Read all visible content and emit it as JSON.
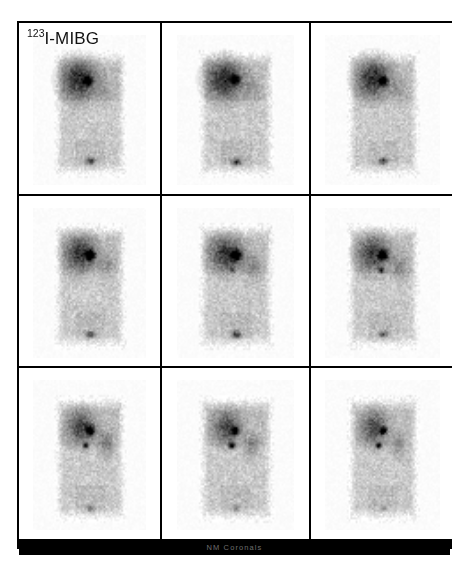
{
  "study": {
    "tracer_label_prefix": "123",
    "tracer_label_main": "I-MIBG",
    "footer_label": "NM Coronals",
    "frame_border_color": "#000000",
    "background_color": "#ffffff",
    "footer_bar_color": "#000000",
    "footer_text_color": "#8e8e8e",
    "grid_rows": 3,
    "grid_cols": 3,
    "modality": "scintigraphy",
    "orientation": "coronal"
  },
  "panels": [
    {
      "id": "slice-r1c1",
      "name": "coronal-slice-1",
      "row": 1,
      "col": 1,
      "seed": 11,
      "body_cx": 50,
      "body_cy": 52,
      "body_w": 58,
      "body_h": 76,
      "liver_cx": 40,
      "liver_cy": 29,
      "liver_rx": 17,
      "liver_ry": 14,
      "liver_intensity": 0.62,
      "hotspots": [
        {
          "cx": 48,
          "cy": 30,
          "r": 4.2,
          "intensity": 0.95
        }
      ],
      "kidney": {
        "cx": 63,
        "cy": 36,
        "rx": 7,
        "ry": 9,
        "intensity": 0.12
      },
      "bladder": {
        "cx": 50,
        "cy": 83,
        "rx": 4,
        "ry": 2.4,
        "intensity": 0.55
      }
    },
    {
      "id": "slice-r1c2",
      "name": "coronal-slice-2",
      "row": 1,
      "col": 2,
      "seed": 27,
      "body_cx": 50,
      "body_cy": 52,
      "body_w": 58,
      "body_h": 76,
      "liver_cx": 40,
      "liver_cy": 29,
      "liver_rx": 17,
      "liver_ry": 14,
      "liver_intensity": 0.6,
      "hotspots": [
        {
          "cx": 49,
          "cy": 29,
          "r": 4.4,
          "intensity": 0.96
        }
      ],
      "kidney": {
        "cx": 64,
        "cy": 36,
        "rx": 7,
        "ry": 9,
        "intensity": 0.14
      },
      "bladder": {
        "cx": 50,
        "cy": 84,
        "rx": 4.2,
        "ry": 2.4,
        "intensity": 0.58
      }
    },
    {
      "id": "slice-r1c3",
      "name": "coronal-slice-3",
      "row": 1,
      "col": 3,
      "seed": 43,
      "body_cx": 50,
      "body_cy": 52,
      "body_w": 57,
      "body_h": 76,
      "liver_cx": 41,
      "liver_cy": 28,
      "liver_rx": 16,
      "liver_ry": 14,
      "liver_intensity": 0.58,
      "hotspots": [
        {
          "cx": 50,
          "cy": 30,
          "r": 4.3,
          "intensity": 0.95
        }
      ],
      "kidney": {
        "cx": 64,
        "cy": 36,
        "rx": 7,
        "ry": 9,
        "intensity": 0.13
      },
      "bladder": {
        "cx": 50,
        "cy": 83,
        "rx": 4,
        "ry": 2.2,
        "intensity": 0.52
      }
    },
    {
      "id": "slice-r2c1",
      "name": "coronal-slice-4",
      "row": 2,
      "col": 1,
      "seed": 59,
      "body_cx": 50,
      "body_cy": 52,
      "body_w": 57,
      "body_h": 76,
      "liver_cx": 41,
      "liver_cy": 30,
      "liver_rx": 15,
      "liver_ry": 13,
      "liver_intensity": 0.55,
      "hotspots": [
        {
          "cx": 50,
          "cy": 31,
          "r": 4.8,
          "intensity": 0.97
        }
      ],
      "kidney": {
        "cx": 64,
        "cy": 38,
        "rx": 7,
        "ry": 9,
        "intensity": 0.16
      },
      "bladder": {
        "cx": 50,
        "cy": 84,
        "rx": 4,
        "ry": 2.2,
        "intensity": 0.5
      }
    },
    {
      "id": "slice-r2c2",
      "name": "coronal-slice-5",
      "row": 2,
      "col": 2,
      "seed": 71,
      "body_cx": 50,
      "body_cy": 52,
      "body_w": 58,
      "body_h": 76,
      "liver_cx": 41,
      "liver_cy": 30,
      "liver_rx": 15,
      "liver_ry": 13,
      "liver_intensity": 0.55,
      "hotspots": [
        {
          "cx": 50,
          "cy": 31,
          "r": 5.2,
          "intensity": 0.98
        },
        {
          "cx": 47,
          "cy": 41,
          "r": 2.4,
          "intensity": 0.45
        }
      ],
      "kidney": {
        "cx": 64,
        "cy": 39,
        "rx": 7.5,
        "ry": 9,
        "intensity": 0.2
      },
      "bladder": {
        "cx": 50,
        "cy": 84,
        "rx": 4.2,
        "ry": 2.4,
        "intensity": 0.55
      }
    },
    {
      "id": "slice-r2c3",
      "name": "coronal-slice-6",
      "row": 2,
      "col": 3,
      "seed": 89,
      "body_cx": 50,
      "body_cy": 52,
      "body_w": 57,
      "body_h": 76,
      "liver_cx": 41,
      "liver_cy": 30,
      "liver_rx": 15,
      "liver_ry": 13,
      "liver_intensity": 0.52,
      "hotspots": [
        {
          "cx": 50,
          "cy": 31,
          "r": 4.6,
          "intensity": 0.96
        },
        {
          "cx": 48,
          "cy": 41,
          "r": 2.8,
          "intensity": 0.72
        }
      ],
      "kidney": {
        "cx": 64,
        "cy": 39,
        "rx": 7.5,
        "ry": 9,
        "intensity": 0.22
      },
      "bladder": {
        "cx": 50,
        "cy": 84,
        "rx": 3.6,
        "ry": 2.2,
        "intensity": 0.42
      }
    },
    {
      "id": "slice-r3c1",
      "name": "coronal-slice-7",
      "row": 3,
      "col": 1,
      "seed": 103,
      "body_cx": 50,
      "body_cy": 52,
      "body_w": 57,
      "body_h": 76,
      "liver_cx": 42,
      "liver_cy": 31,
      "liver_rx": 14,
      "liver_ry": 12,
      "liver_intensity": 0.48,
      "hotspots": [
        {
          "cx": 50,
          "cy": 33,
          "r": 4.4,
          "intensity": 0.97
        },
        {
          "cx": 46,
          "cy": 43,
          "r": 2.6,
          "intensity": 0.88
        }
      ],
      "kidney": {
        "cx": 64,
        "cy": 42,
        "rx": 7,
        "ry": 9,
        "intensity": 0.26
      },
      "bladder": {
        "cx": 50,
        "cy": 85,
        "rx": 3.4,
        "ry": 2.0,
        "intensity": 0.3
      }
    },
    {
      "id": "slice-r3c2",
      "name": "coronal-slice-8",
      "row": 3,
      "col": 2,
      "seed": 127,
      "body_cx": 50,
      "body_cy": 52,
      "body_w": 57,
      "body_h": 76,
      "liver_cx": 42,
      "liver_cy": 31,
      "liver_rx": 13,
      "liver_ry": 12,
      "liver_intensity": 0.45,
      "hotspots": [
        {
          "cx": 49,
          "cy": 33,
          "r": 3.6,
          "intensity": 0.95
        },
        {
          "cx": 46,
          "cy": 43,
          "r": 3.0,
          "intensity": 0.93
        }
      ],
      "kidney": {
        "cx": 63,
        "cy": 43,
        "rx": 6.5,
        "ry": 8,
        "intensity": 0.24
      },
      "bladder": {
        "cx": 50,
        "cy": 85,
        "rx": 3.2,
        "ry": 2.0,
        "intensity": 0.28
      }
    },
    {
      "id": "slice-r3c3",
      "name": "coronal-slice-9",
      "row": 3,
      "col": 3,
      "seed": 149,
      "body_cx": 50,
      "body_cy": 52,
      "body_w": 56,
      "body_h": 76,
      "liver_cx": 42,
      "liver_cy": 31,
      "liver_rx": 13,
      "liver_ry": 12,
      "liver_intensity": 0.44,
      "hotspots": [
        {
          "cx": 50,
          "cy": 33,
          "r": 3.4,
          "intensity": 0.94
        },
        {
          "cx": 46,
          "cy": 43,
          "r": 2.8,
          "intensity": 0.92
        }
      ],
      "kidney": {
        "cx": 63,
        "cy": 43,
        "rx": 6.5,
        "ry": 8,
        "intensity": 0.2
      },
      "bladder": {
        "cx": 50,
        "cy": 85,
        "rx": 3.0,
        "ry": 1.8,
        "intensity": 0.22
      }
    }
  ]
}
